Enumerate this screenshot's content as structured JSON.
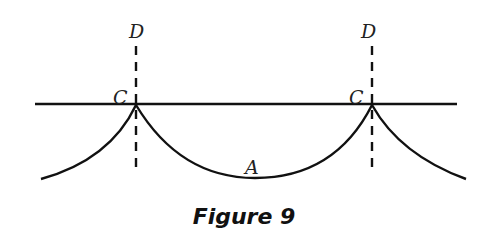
{
  "figure": {
    "caption": "Figure 9",
    "labels": {
      "d_left": "D",
      "d_right": "D",
      "c_left": "C",
      "c_right": "C",
      "a": "A"
    },
    "colors": {
      "line": "#111111",
      "background": "#ffffff"
    }
  }
}
